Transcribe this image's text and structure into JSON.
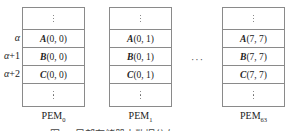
{
  "row_labels": [
    {
      "sym": "α",
      "suffix": ""
    },
    {
      "sym": "α",
      "suffix": "+1"
    },
    {
      "sym": "α",
      "suffix": "+2"
    }
  ],
  "pems": [
    {
      "name": "PEM",
      "sub": "0",
      "cells": [
        {
          "var": "A",
          "idx": "(0, 0)"
        },
        {
          "var": "B",
          "idx": "(0, 0)"
        },
        {
          "var": "C",
          "idx": "(0, 0)"
        }
      ]
    },
    {
      "name": "PEM",
      "sub": "1",
      "cells": [
        {
          "var": "A",
          "idx": "(0, 1)"
        },
        {
          "var": "B",
          "idx": "(0, 1)"
        },
        {
          "var": "C",
          "idx": "(0, 1)"
        }
      ]
    },
    {
      "name": "PEM",
      "sub": "63",
      "cells": [
        {
          "var": "A",
          "idx": "(7, 7)"
        },
        {
          "var": "B",
          "idx": "(7, 7)"
        },
        {
          "var": "C",
          "idx": "(7, 7)"
        }
      ]
    }
  ],
  "ellipsis": "···",
  "caption": "图 … 局部存储器中数据分布"
}
